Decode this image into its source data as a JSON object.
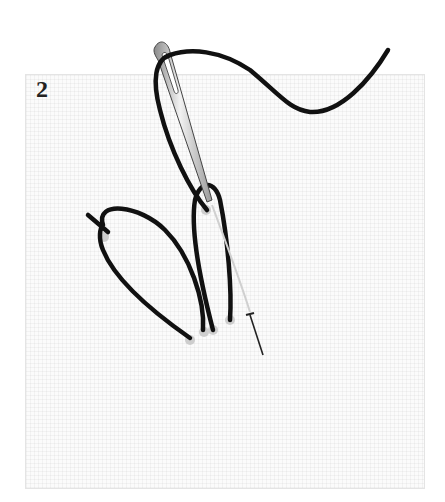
{
  "diagram": {
    "step_number": "2",
    "elements": [
      "fabric-square",
      "needle",
      "thread",
      "loop-stitch-1",
      "loop-stitch-2",
      "pin"
    ],
    "colors": {
      "thread": "#111111",
      "needle": "#c8c8c8",
      "fabric": "#fbfbfb",
      "hole_shadow": "#bdbdbd"
    }
  }
}
